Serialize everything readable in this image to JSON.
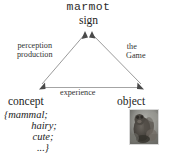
{
  "diagram": {
    "type": "semiotic-triangle",
    "apex": {
      "word": "marmot",
      "role": "sign"
    },
    "bottom_left": {
      "role": "concept",
      "features": [
        "{mammal;",
        "hairy;",
        "cute;",
        "...}"
      ]
    },
    "bottom_right": {
      "role": "object",
      "image_alt": "marmot-photo"
    },
    "edges": {
      "left": {
        "line1": "perception",
        "line2": "production"
      },
      "right": {
        "line1": "the",
        "line2": "Game"
      },
      "bottom": {
        "label": "experience"
      }
    },
    "colors": {
      "line": "#8a8a8a",
      "text": "#1d1d1d",
      "background": "#ffffff"
    }
  }
}
